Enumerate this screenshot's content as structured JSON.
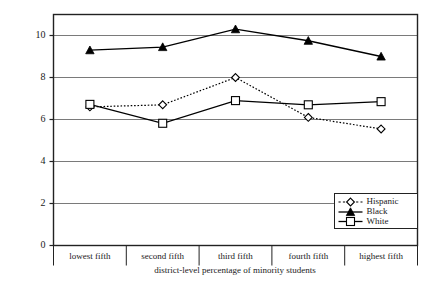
{
  "chart_data": {
    "type": "line",
    "title": "",
    "xlabel": "district-level percentage of minority students",
    "ylabel": "%LD",
    "categories": [
      "lowest fifth",
      "second fifth",
      "third fifth",
      "fourth fifth",
      "highest fifth"
    ],
    "ylim": [
      0,
      11
    ],
    "yticks": [
      0,
      2,
      4,
      6,
      8,
      10
    ],
    "grid": true,
    "legend_position": "bottom-right",
    "series": [
      {
        "name": "Hispanic",
        "values": [
          6.6,
          6.7,
          8.0,
          6.1,
          5.55
        ],
        "line_style": "dotted",
        "marker": "open-diamond",
        "color": "#000000"
      },
      {
        "name": "Black",
        "values": [
          9.3,
          9.45,
          10.3,
          9.75,
          9.0
        ],
        "line_style": "solid",
        "marker": "filled-triangle",
        "color": "#000000"
      },
      {
        "name": "White",
        "values": [
          6.72,
          5.82,
          6.9,
          6.7,
          6.85
        ],
        "line_style": "solid",
        "marker": "open-square",
        "color": "#000000"
      }
    ]
  },
  "axes": {
    "y_tick_labels": [
      "0",
      "2",
      "4",
      "6",
      "8",
      "10"
    ],
    "x_tick_labels": [
      "lowest fifth",
      "second fifth",
      "third fifth",
      "fourth fifth",
      "highest fifth"
    ]
  },
  "legend": {
    "entries": [
      {
        "label": "Hispanic"
      },
      {
        "label": "Black"
      },
      {
        "label": "White"
      }
    ]
  },
  "colors": {
    "ink": "#000000",
    "grid": "#7a7a7a",
    "frame": "#222222",
    "background": "#ffffff"
  }
}
